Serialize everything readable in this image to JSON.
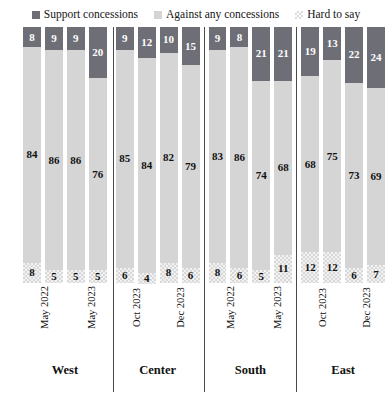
{
  "legend": {
    "position": "top",
    "entries": [
      {
        "label": "Support concessions",
        "color": "#6e6e76",
        "swatch": "solid-square-icon"
      },
      {
        "label": "Against any concessions",
        "color": "#d5d5d5",
        "swatch": "solid-square-icon"
      },
      {
        "label": "Hard to say",
        "color": "#f2f2f2",
        "swatch": "checkered-square-icon"
      }
    ]
  },
  "chart_data": {
    "type": "bar",
    "subtype": "100-percent-stacked-column",
    "title": "",
    "subtitle": "",
    "xlabel": "",
    "ylabel": "",
    "ylim": [
      0,
      100
    ],
    "grid": false,
    "legend_position": "top",
    "orientation": "vertical",
    "categories": [
      "May 2022",
      "May 2023",
      "Oct 2023",
      "Dec 2023",
      "May 2022",
      "May 2023",
      "Oct 2023",
      "Dec 2023",
      "May 2022",
      "May 2023",
      "Oct 2023",
      "Dec 2023",
      "May 2022",
      "May 2023",
      "Oct 2023",
      "Dec 2023"
    ],
    "groups": [
      "West",
      "Center",
      "South",
      "East"
    ],
    "series": [
      {
        "name": "Support concessions",
        "color": "#6e6e76",
        "values": [
          8,
          9,
          9,
          20,
          9,
          12,
          10,
          15,
          9,
          8,
          21,
          21,
          19,
          13,
          22,
          24
        ]
      },
      {
        "name": "Against any concessions",
        "color": "#d5d5d5",
        "values": [
          84,
          86,
          86,
          76,
          85,
          84,
          82,
          79,
          83,
          86,
          74,
          68,
          68,
          75,
          73,
          69
        ]
      },
      {
        "name": "Hard to say",
        "color": "#f2f2f2",
        "values": [
          8,
          5,
          5,
          5,
          6,
          4,
          8,
          6,
          8,
          6,
          5,
          11,
          12,
          12,
          6,
          7
        ]
      }
    ]
  },
  "groups": [
    {
      "name": "West",
      "bars": [
        {
          "period": "May 2022",
          "support": 8,
          "against": 84,
          "hard": 8
        },
        {
          "period": "May 2023",
          "support": 9,
          "against": 86,
          "hard": 5
        },
        {
          "period": "Oct 2023",
          "support": 9,
          "against": 86,
          "hard": 5
        },
        {
          "period": "Dec 2023",
          "support": 20,
          "against": 76,
          "hard": 5
        }
      ]
    },
    {
      "name": "Center",
      "bars": [
        {
          "period": "May 2022",
          "support": 9,
          "against": 85,
          "hard": 6
        },
        {
          "period": "May 2023",
          "support": 12,
          "against": 84,
          "hard": 4
        },
        {
          "period": "Oct 2023",
          "support": 10,
          "against": 82,
          "hard": 8
        },
        {
          "period": "Dec 2023",
          "support": 15,
          "against": 79,
          "hard": 6
        }
      ]
    },
    {
      "name": "South",
      "bars": [
        {
          "period": "May 2022",
          "support": 9,
          "against": 83,
          "hard": 8
        },
        {
          "period": "May 2023",
          "support": 8,
          "against": 86,
          "hard": 6
        },
        {
          "period": "Oct 2023",
          "support": 21,
          "against": 74,
          "hard": 5
        },
        {
          "period": "Dec 2023",
          "support": 21,
          "against": 68,
          "hard": 11
        }
      ]
    },
    {
      "name": "East",
      "bars": [
        {
          "period": "May 2022",
          "support": 19,
          "against": 68,
          "hard": 12
        },
        {
          "period": "May 2023",
          "support": 13,
          "against": 75,
          "hard": 12
        },
        {
          "period": "Oct 2023",
          "support": 22,
          "against": 73,
          "hard": 6
        },
        {
          "period": "Dec 2023",
          "support": 24,
          "against": 69,
          "hard": 7
        }
      ]
    }
  ]
}
